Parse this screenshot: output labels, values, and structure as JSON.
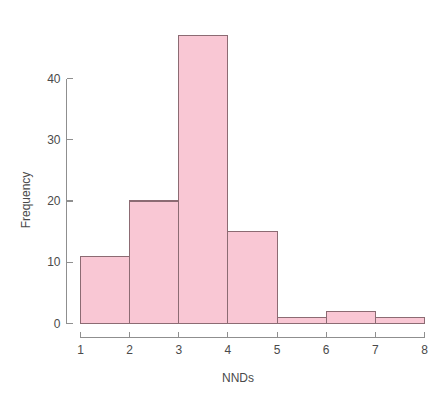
{
  "chart_data": {
    "type": "bar",
    "title": "",
    "subtitle": "",
    "xlabel": "NNDs",
    "ylabel": "Frequency",
    "categories": [
      "1-2",
      "2-3",
      "3-4",
      "4-5",
      "5-6",
      "6-7",
      "7-8"
    ],
    "bin_edges": [
      1,
      2,
      3,
      4,
      5,
      6,
      7,
      8
    ],
    "values": [
      11,
      20,
      47,
      15,
      1,
      2,
      1
    ],
    "xlim": [
      1,
      8
    ],
    "ylim": [
      0,
      47
    ],
    "x_ticks": [
      "1",
      "2",
      "3",
      "4",
      "5",
      "6",
      "7",
      "8"
    ],
    "x_tick_values": [
      1,
      2,
      3,
      4,
      5,
      6,
      7,
      8
    ],
    "y_ticks": [
      "0",
      "10",
      "20",
      "30",
      "40"
    ],
    "y_tick_values": [
      0,
      10,
      20,
      30,
      40
    ],
    "grid": false,
    "legend": false,
    "legend_position": "none",
    "bar_fill_color": "#f9c7d4",
    "bar_border_color": "#8c6b73",
    "axis_color": "#8f8f8f",
    "text_color": "#4a4a4a",
    "background_color": "#ffffff"
  },
  "axes": {
    "x_title": "NNDs",
    "y_title": "Frequency"
  },
  "ticks": {
    "x": [
      "1",
      "2",
      "3",
      "4",
      "5",
      "6",
      "7",
      "8"
    ],
    "y": [
      "0",
      "10",
      "20",
      "30",
      "40"
    ]
  }
}
